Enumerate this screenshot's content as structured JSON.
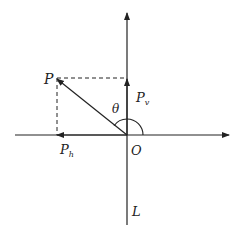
{
  "diagram": {
    "labels": {
      "point": "P",
      "vertical_component": "P",
      "vertical_sub": "v",
      "horizontal_component": "P",
      "horizontal_sub": "h",
      "angle": "θ",
      "origin": "O",
      "axis": "L"
    },
    "colors": {
      "stroke": "#222222",
      "background": "#ffffff"
    }
  }
}
